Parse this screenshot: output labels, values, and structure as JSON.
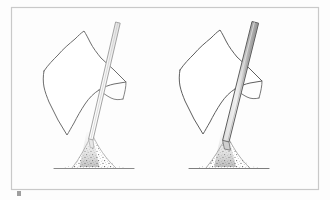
{
  "figure": {
    "kind": "line-drawing",
    "background_color": "#fdfdfd",
    "frame": {
      "name": "figure-border",
      "stroke_color": "#c9c9c9",
      "x": 11,
      "y": 7,
      "width": 307,
      "height": 182
    },
    "panels": [
      {
        "id": "left",
        "label": "",
        "pole": {
          "style": "thin-outline",
          "fill_color": "#fbfbfb",
          "stroke_color": "#9a9a9a",
          "width_px": 5,
          "tilt": "leaning-right"
        },
        "cloth": {
          "style": "outline-only",
          "stroke_color": "#6d6d6d",
          "fill_color": "#ffffff"
        },
        "mound": {
          "style": "stippled",
          "stroke_color": "#7a7a7a",
          "ground_line_color": "#8a8a8a"
        }
      },
      {
        "id": "right",
        "label": "",
        "pole": {
          "style": "thick-shaded",
          "fill_color": "#b9b9b9",
          "stroke_color": "#5e5e5e",
          "width_px": 9,
          "tilt": "leaning-right"
        },
        "cloth": {
          "style": "outline-only",
          "stroke_color": "#5e5e5e",
          "fill_color": "#ffffff"
        },
        "mound": {
          "style": "stippled",
          "stroke_color": "#6a6a6a",
          "ground_line_color": "#7d7d7d"
        }
      }
    ],
    "artifacts": [
      {
        "name": "scan-smudge",
        "x": 17,
        "y": 191,
        "width": 4,
        "height": 5,
        "color": "#8d8d8d"
      }
    ],
    "captions": []
  }
}
